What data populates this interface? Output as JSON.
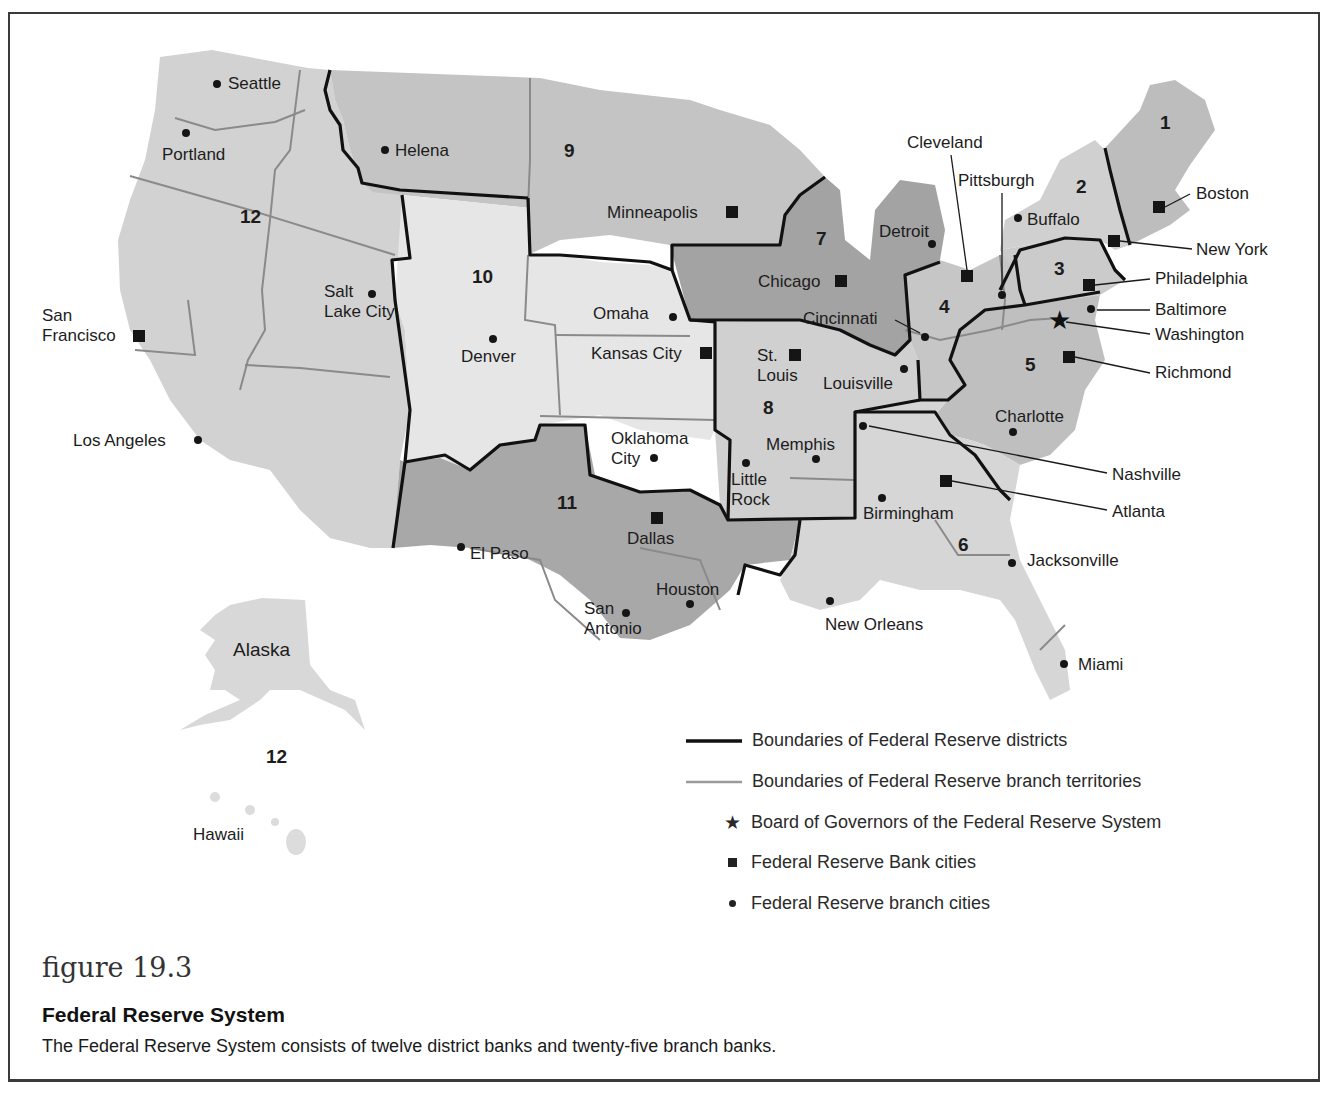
{
  "figure": {
    "number": "figure 19.3",
    "title": "Federal Reserve System",
    "caption": "The Federal Reserve System consists of twelve district banks and twenty-five branch banks."
  },
  "colors": {
    "district_light": "#e4e4e4",
    "district_medium": "#cfcfcf",
    "district_dark": "#a9a9a9",
    "district_darker": "#8f8f8f",
    "district_boundary": "#111111",
    "branch_boundary": "#8a8a8a",
    "state_line": "#ffffff"
  },
  "districts": [
    {
      "number": "1",
      "x": 1160,
      "y": 112
    },
    {
      "number": "2",
      "x": 1076,
      "y": 176
    },
    {
      "number": "3",
      "x": 1054,
      "y": 258
    },
    {
      "number": "4",
      "x": 939,
      "y": 296
    },
    {
      "number": "5",
      "x": 1025,
      "y": 354
    },
    {
      "number": "6",
      "x": 958,
      "y": 534
    },
    {
      "number": "7",
      "x": 816,
      "y": 228
    },
    {
      "number": "8",
      "x": 763,
      "y": 397
    },
    {
      "number": "9",
      "x": 564,
      "y": 140
    },
    {
      "number": "10",
      "x": 472,
      "y": 266
    },
    {
      "number": "11",
      "x": 557,
      "y": 492
    },
    {
      "number": "12",
      "x": 240,
      "y": 206
    },
    {
      "number": "12",
      "x": 266,
      "y": 746
    }
  ],
  "bank_cities": [
    {
      "name": "Boston",
      "label": "Boston",
      "mx": 1159,
      "my": 207,
      "lx": 1196,
      "ly": 184
    },
    {
      "name": "New York",
      "label": "New York",
      "mx": 1114,
      "my": 241,
      "lx": 1196,
      "ly": 240
    },
    {
      "name": "Philadelphia",
      "label": "Philadelphia",
      "mx": 1089,
      "my": 285,
      "lx": 1155,
      "ly": 269
    },
    {
      "name": "Cleveland",
      "label": "Cleveland",
      "mx": 967,
      "my": 276,
      "lx": 907,
      "ly": 133
    },
    {
      "name": "Richmond",
      "label": "Richmond",
      "mx": 1069,
      "my": 357,
      "lx": 1155,
      "ly": 363
    },
    {
      "name": "Atlanta",
      "label": "Atlanta",
      "mx": 946,
      "my": 481,
      "lx": 1112,
      "ly": 502
    },
    {
      "name": "Chicago",
      "label": "Chicago",
      "mx": 841,
      "my": 281,
      "lx": 758,
      "ly": 272
    },
    {
      "name": "St. Louis",
      "label": "St.\nLouis",
      "mx": 795,
      "my": 355,
      "lx": 757,
      "ly": 346
    },
    {
      "name": "Minneapolis",
      "label": "Minneapolis",
      "mx": 732,
      "my": 212,
      "lx": 607,
      "ly": 203
    },
    {
      "name": "Kansas City",
      "label": "Kansas City",
      "mx": 706,
      "my": 353,
      "lx": 591,
      "ly": 344
    },
    {
      "name": "Dallas",
      "label": "Dallas",
      "mx": 657,
      "my": 518,
      "lx": 627,
      "ly": 529
    },
    {
      "name": "San Francisco",
      "label": "San\nFrancisco",
      "mx": 139,
      "my": 336,
      "lx": 42,
      "ly": 306
    }
  ],
  "branch_cities": [
    {
      "name": "Seattle",
      "mx": 217,
      "my": 84,
      "lx": 228,
      "ly": 74
    },
    {
      "name": "Portland",
      "mx": 186,
      "my": 133,
      "lx": 162,
      "ly": 145
    },
    {
      "name": "Helena",
      "mx": 385,
      "my": 150,
      "lx": 395,
      "ly": 141
    },
    {
      "name": "Salt Lake City",
      "label": "Salt\nLake City",
      "mx": 372,
      "my": 294,
      "lx": 324,
      "ly": 282
    },
    {
      "name": "Los Angeles",
      "mx": 198,
      "my": 440,
      "lx": 73,
      "ly": 431
    },
    {
      "name": "Denver",
      "mx": 493,
      "my": 339,
      "lx": 461,
      "ly": 347
    },
    {
      "name": "Omaha",
      "mx": 673,
      "my": 317,
      "lx": 593,
      "ly": 304
    },
    {
      "name": "Oklahoma City",
      "label": "Oklahoma\nCity",
      "mx": 654,
      "my": 458,
      "lx": 611,
      "ly": 429
    },
    {
      "name": "El Paso",
      "mx": 461,
      "my": 547,
      "lx": 470,
      "ly": 544
    },
    {
      "name": "San Antonio",
      "label": "San\nAntonio",
      "mx": 626,
      "my": 613,
      "lx": 584,
      "ly": 599
    },
    {
      "name": "Houston",
      "mx": 690,
      "my": 604,
      "lx": 656,
      "ly": 580
    },
    {
      "name": "Little Rock",
      "label": "Little\nRock",
      "mx": 746,
      "my": 463,
      "lx": 731,
      "ly": 470
    },
    {
      "name": "Memphis",
      "mx": 816,
      "my": 459,
      "lx": 766,
      "ly": 435
    },
    {
      "name": "Louisville",
      "mx": 904,
      "my": 369,
      "lx": 823,
      "ly": 374
    },
    {
      "name": "Cincinnati",
      "mx": 925,
      "my": 337,
      "lx": 803,
      "ly": 309
    },
    {
      "name": "Detroit",
      "mx": 932,
      "my": 244,
      "lx": 879,
      "ly": 222
    },
    {
      "name": "Buffalo",
      "mx": 1018,
      "my": 218,
      "lx": 1027,
      "ly": 210
    },
    {
      "name": "Pittsburgh",
      "mx": 1002,
      "my": 295,
      "lx": 958,
      "ly": 171
    },
    {
      "name": "Baltimore",
      "mx": 1091,
      "my": 309,
      "lx": 1155,
      "ly": 300
    },
    {
      "name": "Charlotte",
      "mx": 1013,
      "my": 432,
      "lx": 995,
      "ly": 407
    },
    {
      "name": "Nashville",
      "mx": 863,
      "my": 426,
      "lx": 1112,
      "ly": 465
    },
    {
      "name": "Birmingham",
      "mx": 882,
      "my": 498,
      "lx": 863,
      "ly": 504
    },
    {
      "name": "New Orleans",
      "mx": 830,
      "my": 601,
      "lx": 825,
      "ly": 615
    },
    {
      "name": "Jacksonville",
      "mx": 1012,
      "my": 563,
      "lx": 1027,
      "ly": 551
    },
    {
      "name": "Miami",
      "mx": 1064,
      "my": 664,
      "lx": 1078,
      "ly": 655
    }
  ],
  "board": {
    "name": "Washington",
    "mx": 1060,
    "my": 321,
    "lx": 1155,
    "ly": 325
  },
  "territories": [
    {
      "name": "Alaska",
      "lx": 233,
      "ly": 640
    },
    {
      "name": "Hawaii",
      "lx": 193,
      "ly": 825
    }
  ],
  "legend": {
    "items": [
      {
        "symbol": "district-boundary-line",
        "label": "Boundaries of Federal Reserve districts"
      },
      {
        "symbol": "branch-boundary-line",
        "label": "Boundaries of Federal Reserve branch territories"
      },
      {
        "symbol": "star",
        "label": "Board of Governors of the Federal Reserve System"
      },
      {
        "symbol": "square",
        "label": "Federal Reserve Bank cities"
      },
      {
        "symbol": "dot",
        "label": "Federal Reserve branch cities"
      }
    ]
  }
}
